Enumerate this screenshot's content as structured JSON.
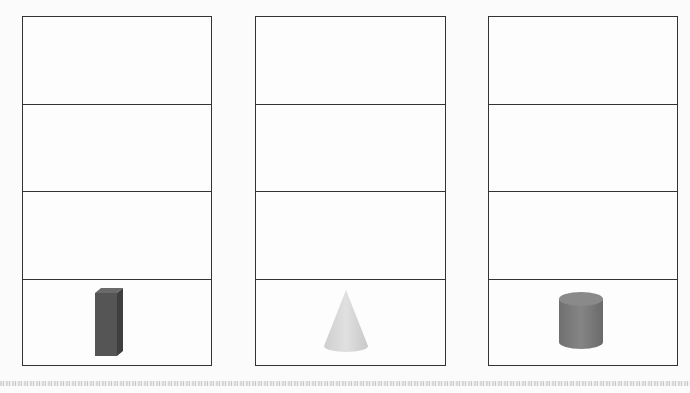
{
  "columns": [
    {
      "id": "column-1",
      "rows": 4,
      "object": {
        "type": "rectangular-prism",
        "color": "#555555",
        "row": 4
      }
    },
    {
      "id": "column-2",
      "rows": 4,
      "object": {
        "type": "cone",
        "color": "#d9d9d9",
        "row": 4
      }
    },
    {
      "id": "column-3",
      "rows": 4,
      "object": {
        "type": "cylinder",
        "color": "#7a7a7a",
        "row": 4
      }
    }
  ],
  "colors": {
    "border": "#333333",
    "background": "#fbfbfb"
  }
}
